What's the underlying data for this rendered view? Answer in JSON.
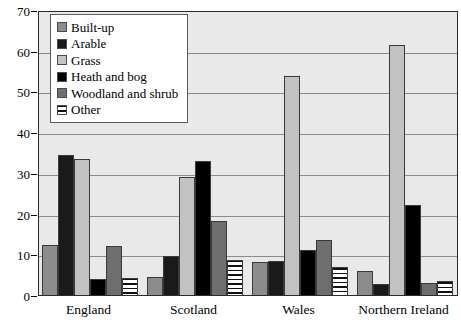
{
  "chart_data": {
    "type": "bar",
    "title": "",
    "xlabel": "",
    "ylabel": "",
    "ylim": [
      0,
      70
    ],
    "yticks": [
      0,
      10,
      20,
      30,
      40,
      50,
      60,
      70
    ],
    "grid": true,
    "legend_position": "top-left",
    "categories": [
      "England",
      "Scotland",
      "Wales",
      "Northern Ireland"
    ],
    "series": [
      {
        "name": "Built-up",
        "color": "#8c8c8c",
        "pattern": "solid",
        "values": [
          12.2,
          4.5,
          8.0,
          6.0
        ]
      },
      {
        "name": "Arable",
        "color": "#1a1a1a",
        "pattern": "solid",
        "values": [
          34.5,
          9.5,
          8.3,
          2.8
        ]
      },
      {
        "name": "Grass",
        "color": "#c2c2c2",
        "pattern": "solid",
        "values": [
          33.5,
          29.0,
          53.7,
          61.5
        ]
      },
      {
        "name": "Heath and bog",
        "color": "#000000",
        "pattern": "solid",
        "values": [
          4.0,
          33.0,
          11.0,
          22.0
        ]
      },
      {
        "name": "Woodland and shrub",
        "color": "#6e6e6e",
        "pattern": "solid",
        "values": [
          12.0,
          18.2,
          13.5,
          3.0
        ]
      },
      {
        "name": "Other",
        "color": "#ffffff",
        "pattern": "horizontal-stripe",
        "values": [
          4.3,
          8.5,
          7.0,
          3.5
        ]
      }
    ]
  },
  "axis": {
    "y_tick_labels": [
      "0",
      "10",
      "20",
      "30",
      "40",
      "50",
      "60",
      "70"
    ],
    "x_tick_labels": [
      "England",
      "Scotland",
      "Wales",
      "Northern Ireland"
    ]
  },
  "legend": {
    "items": [
      {
        "label": "Built-up"
      },
      {
        "label": "Arable"
      },
      {
        "label": "Grass"
      },
      {
        "label": "Heath and bog"
      },
      {
        "label": "Woodland and shrub"
      },
      {
        "label": "Other"
      }
    ]
  },
  "colors": {
    "plot_background": "#e9e9e9",
    "gridline": "#8a8a8a",
    "axis": "#2b2b2b",
    "page_background": "#ffffff"
  }
}
